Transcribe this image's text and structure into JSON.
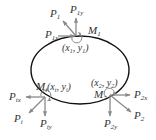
{
  "diagram": {
    "type": "free-body force diagram on closed curve",
    "curve": {
      "shape": "ellipse",
      "stroke": "#111111"
    },
    "arrow_color": "#8a8a8a",
    "label_color": "#333333",
    "points": [
      {
        "id": "1",
        "coord_label": "(x1, y1)",
        "coord_main": "(x",
        "coord_sub1": "1",
        "coord_mid": ", y",
        "coord_sub2": "1",
        "coord_end": ")",
        "moment": {
          "main": "M",
          "sub": "1"
        },
        "forces": [
          {
            "main": "P",
            "sub": "1",
            "direction": "up-left"
          },
          {
            "main": "P",
            "sub": "1y",
            "direction": "up"
          },
          {
            "main": "P",
            "sub": "1x",
            "direction": "right"
          }
        ]
      },
      {
        "id": "i",
        "coord_label": "(xi, yi)",
        "coord_main": "(x",
        "coord_sub1": "i",
        "coord_mid": ", y",
        "coord_sub2": "i",
        "coord_end": ")",
        "moment": {
          "main": "M",
          "sub": "i"
        },
        "forces": [
          {
            "main": "P",
            "sub": "ix",
            "direction": "left"
          },
          {
            "main": "P",
            "sub": "i",
            "direction": "down-left"
          },
          {
            "main": "P",
            "sub": "iy",
            "direction": "down"
          }
        ]
      },
      {
        "id": "2",
        "coord_label": "(x2, y2)",
        "coord_main": "(x",
        "coord_sub1": "2",
        "coord_mid": ", y",
        "coord_sub2": "2",
        "coord_end": ")",
        "moment": {
          "main": "M",
          "sub": "2"
        },
        "forces": [
          {
            "main": "P",
            "sub": "2x",
            "direction": "right"
          },
          {
            "main": "P",
            "sub": "2",
            "direction": "down-right"
          },
          {
            "main": "P",
            "sub": "2y",
            "direction": "down"
          }
        ]
      }
    ]
  }
}
